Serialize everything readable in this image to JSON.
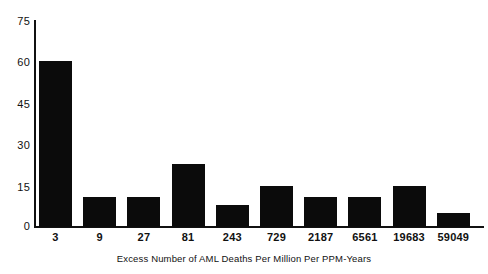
{
  "chart_data": {
    "type": "bar",
    "title": "",
    "subtitle": "",
    "xlabel": "Excess Number of AML Deaths Per Million Per PPM-Years",
    "ylabel": "",
    "categories": [
      "3",
      "9",
      "27",
      "81",
      "243",
      "729",
      "2187",
      "6561",
      "19683",
      "59049"
    ],
    "values": [
      60,
      11,
      11,
      23,
      8,
      15,
      11,
      11,
      15,
      5
    ],
    "series": [
      {
        "name": "Count",
        "values": [
          60,
          11,
          11,
          23,
          8,
          15,
          11,
          11,
          15,
          5
        ]
      }
    ],
    "ylim": [
      0,
      75
    ],
    "yticks": [
      0,
      15,
      30,
      45,
      60,
      75
    ],
    "ytick_labels": [
      "0",
      "15",
      "30",
      "45",
      "60",
      "75"
    ],
    "grid": false,
    "legend": null,
    "legend_position": "none",
    "bar_color": "#0b0b0b",
    "axis_color": "#111111",
    "background_color": "#ffffff",
    "annotations": []
  },
  "axes": {
    "y_ticks": [
      {
        "label": "75",
        "value": 75
      },
      {
        "label": "60",
        "value": 60
      },
      {
        "label": "45",
        "value": 45
      },
      {
        "label": "30",
        "value": 30
      },
      {
        "label": "15",
        "value": 15
      },
      {
        "label": "0",
        "value": 0
      }
    ],
    "x_title": "Excess Number of AML Deaths Per Million Per PPM-Years"
  }
}
